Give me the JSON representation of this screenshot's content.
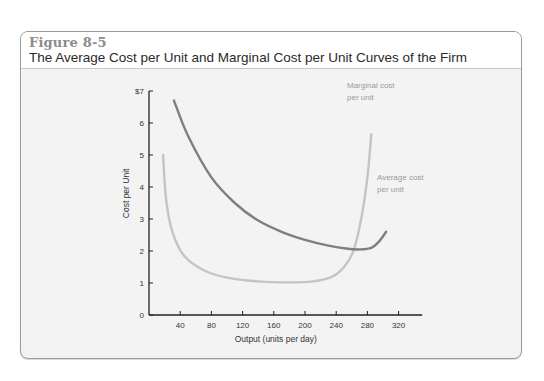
{
  "figure": {
    "label": "Figure 8-5",
    "title": "The Average Cost per Unit and Marginal Cost per Unit Curves of the Firm"
  },
  "colors": {
    "average_cost": "#7f7f7f",
    "marginal_cost": "#c4c4c4",
    "axis": "#222222",
    "label_text": "#9a9a9a"
  },
  "chart_data": {
    "type": "line",
    "title": "The Average Cost per Unit and Marginal Cost per Unit Curves of the Firm",
    "xlabel": "Output (units per day)",
    "ylabel": "Cost per Unit",
    "xlim": [
      0,
      340
    ],
    "ylim": [
      0,
      7
    ],
    "x_ticks": [
      40,
      80,
      120,
      160,
      200,
      240,
      280,
      320
    ],
    "y_ticks": [
      0,
      1,
      2,
      3,
      4,
      5,
      6,
      7
    ],
    "y_tick_labels": [
      "0",
      "1",
      "2",
      "3",
      "4",
      "5",
      "6",
      "$7"
    ],
    "grid": false,
    "legend": "inline labels",
    "series": [
      {
        "name": "Average cost per unit",
        "label_lines": [
          "Average cost",
          "per unit"
        ],
        "x": [
          32,
          50,
          80,
          110,
          140,
          170,
          200,
          230,
          255,
          270,
          285,
          295,
          304
        ],
        "y": [
          6.7,
          5.6,
          4.3,
          3.5,
          2.95,
          2.6,
          2.35,
          2.17,
          2.07,
          2.05,
          2.1,
          2.3,
          2.6
        ]
      },
      {
        "name": "Marginal cost per unit",
        "label_lines": [
          "Marginal cost",
          "per unit"
        ],
        "x": [
          18,
          22,
          30,
          45,
          70,
          100,
          140,
          180,
          210,
          235,
          250,
          262,
          272,
          280,
          285
        ],
        "y": [
          5.0,
          3.6,
          2.6,
          1.85,
          1.4,
          1.17,
          1.05,
          1.02,
          1.05,
          1.2,
          1.5,
          2.0,
          3.0,
          4.3,
          5.65
        ]
      }
    ]
  }
}
